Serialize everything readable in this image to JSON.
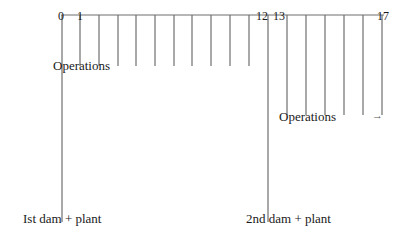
{
  "diagram": {
    "axis": {
      "tick_labels": [
        {
          "text": "0",
          "x": 58,
          "y": 9
        },
        {
          "text": "1",
          "x": 77,
          "y": 9
        },
        {
          "text": "12",
          "x": 256,
          "y": 9
        },
        {
          "text": "13",
          "x": 272,
          "y": 9
        },
        {
          "text": "17",
          "x": 377,
          "y": 9
        }
      ]
    },
    "labels": {
      "operations_1": "Operations",
      "operations_2": "Operations",
      "first_dam": "Ist dam + plant",
      "second_dam": "2nd dam + plant",
      "arrow": "→"
    },
    "structure": {
      "timeline_y": 15,
      "timeline_x_start": 61,
      "timeline_x_end": 384,
      "long_lines": [
        {
          "x": 62,
          "y_end": 222,
          "label": "first_dam"
        },
        {
          "x": 268,
          "y_end": 222,
          "label": "second_dam"
        }
      ],
      "first_operations_lines": [
        80,
        99,
        118,
        136,
        155,
        174,
        192,
        211,
        230,
        249
      ],
      "first_operations_y_end": 66,
      "second_operations_lines": [
        287,
        306,
        325,
        344,
        363,
        382
      ],
      "second_operations_y_end": 115
    },
    "colors": {
      "line": "#6e6e6e",
      "text": "#1a1a1a",
      "background": "#ffffff"
    }
  }
}
